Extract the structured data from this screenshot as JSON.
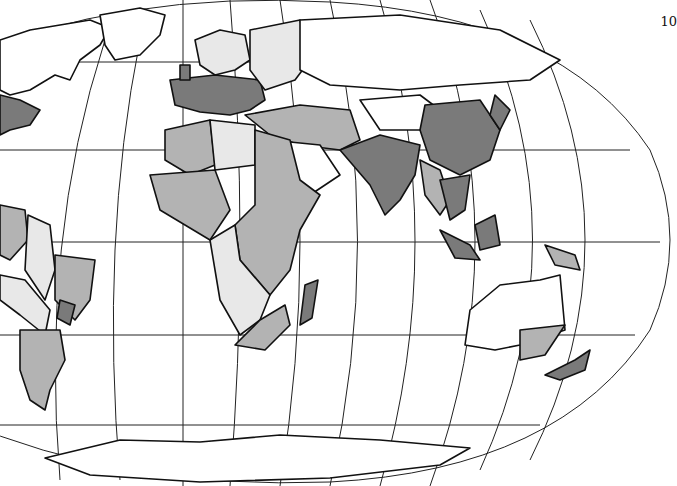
{
  "figure": {
    "page_number": "10",
    "projection": "pseudo-cylindrical equal-area (world, Atlantic-centered, cropped left)",
    "shading_levels": [
      {
        "name": "white",
        "color": "#ffffff"
      },
      {
        "name": "light-gray",
        "color": "#e8e8e8"
      },
      {
        "name": "medium-gray",
        "color": "#b3b3b3"
      },
      {
        "name": "dark-gray",
        "color": "#7a7a7a"
      }
    ],
    "outline_color": "#111111"
  }
}
